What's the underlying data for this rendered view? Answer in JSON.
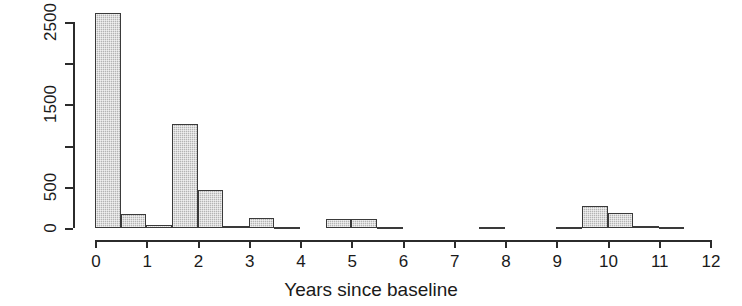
{
  "chart_data": {
    "type": "bar",
    "title": "",
    "xlabel": "Years since baseline",
    "ylabel": "Frequency",
    "xlim": [
      0,
      12
    ],
    "ylim": [
      0,
      2700
    ],
    "binwidth": 0.5,
    "grid": false,
    "legend": null,
    "xticks": [
      "0",
      "1",
      "2",
      "3",
      "4",
      "5",
      "6",
      "7",
      "8",
      "9",
      "10",
      "11",
      "12"
    ],
    "xtick_values": [
      0,
      1,
      2,
      3,
      4,
      5,
      6,
      7,
      8,
      9,
      10,
      11,
      12
    ],
    "yticks": [
      "0",
      "500",
      "1500",
      "2500"
    ],
    "ytick_values": [
      0,
      500,
      1500,
      2500
    ],
    "ytick_minor_values": [
      1000,
      2000
    ],
    "bin_starts": [
      0,
      0.5,
      1,
      1.5,
      2,
      2.5,
      3,
      3.5,
      4,
      4.5,
      5,
      5.5,
      6,
      6.5,
      7,
      7.5,
      8,
      8.5,
      9,
      9.5,
      10,
      10.5,
      11,
      11.5
    ],
    "categories": [
      "0-0.5",
      "0.5-1",
      "1-1.5",
      "1.5-2",
      "2-2.5",
      "2.5-3",
      "3-3.5",
      "3.5-4",
      "4-4.5",
      "4.5-5",
      "5-5.5",
      "5.5-6",
      "6-6.5",
      "6.5-7",
      "7-7.5",
      "7.5-8",
      "8-8.5",
      "8.5-9",
      "9-9.5",
      "9.5-10",
      "10-10.5",
      "10.5-11",
      "11-11.5",
      "11.5-12"
    ],
    "values": [
      2610,
      170,
      35,
      1265,
      460,
      30,
      120,
      5,
      0,
      110,
      110,
      5,
      0,
      0,
      0,
      5,
      0,
      0,
      5,
      270,
      185,
      20,
      10,
      0
    ],
    "bar_fill": "#b4b4b4",
    "bar_border": "#3a3a3a",
    "axis_color": "#2b2b2b"
  }
}
